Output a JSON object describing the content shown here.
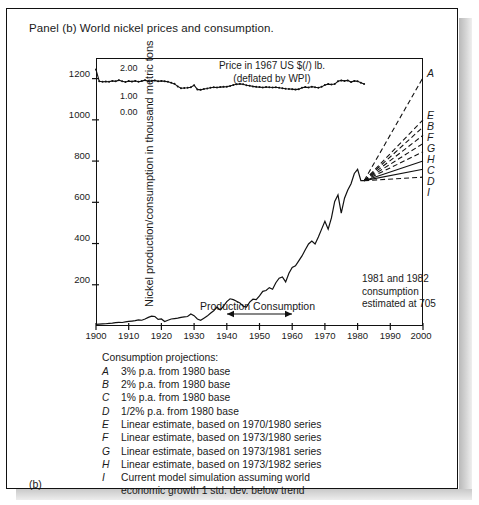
{
  "panel": {
    "title": "Panel (b)  World nickel prices and consumption.",
    "figure_label": "(b)"
  },
  "axes": {
    "ylabel": "Nickel production/consumption in thousand metric tons",
    "yticks": [
      "200",
      "400",
      "600",
      "800",
      "1000",
      "1200"
    ],
    "xticks": [
      "1900",
      "1910",
      "1920",
      "1930",
      "1940",
      "1950",
      "1960",
      "1970",
      "1980",
      "1990",
      "2000"
    ],
    "price_ticks": [
      "0.00",
      "1.00",
      "2.00"
    ]
  },
  "inset": {
    "title_line1": "Price in 1967 US $(/) lb.",
    "title_line2": "(deflated by WPI)"
  },
  "annotations": {
    "estimate": {
      "line1": "1981 and 1982",
      "line2": "consumption",
      "line3": "estimated at 705"
    },
    "production_consumption": "Production Consumption"
  },
  "projection_labels": [
    "A",
    "E",
    "B",
    "F",
    "G",
    "H",
    "C",
    "D",
    "I"
  ],
  "legend": {
    "heading": "Consumption projections:",
    "items": [
      {
        "key": "A",
        "text": "3% p.a. from 1980 base"
      },
      {
        "key": "B",
        "text": "2% p.a. from 1980 base"
      },
      {
        "key": "C",
        "text": "1% p.a. from 1980 base"
      },
      {
        "key": "D",
        "text": "1/2% p.a. from 1980 base"
      },
      {
        "key": "E",
        "text": "Linear estimate, based on 1970/1980 series"
      },
      {
        "key": "F",
        "text": "Linear estimate, based on 1973/1980 series"
      },
      {
        "key": "G",
        "text": "Linear estimate, based on 1973/1981 series"
      },
      {
        "key": "H",
        "text": "Linear estimate, based on 1973/1982 series"
      },
      {
        "key": "I",
        "text": "Current model simulation assuming world"
      }
    ],
    "continuation": "economic growth 1 std. dev. below trend"
  },
  "colors": {
    "ink": "#1a1a1a",
    "line": "#111111",
    "page": "#ffffff"
  },
  "chart_data": {
    "type": "line",
    "title": "World nickel prices and consumption",
    "xlabel": "",
    "ylabel": "Nickel production/consumption in thousand metric tons",
    "xlim": [
      1900,
      2000
    ],
    "ylim": [
      0,
      1300
    ],
    "y2lim": [
      0,
      2.0
    ],
    "y2label": "Price in 1967 US $(/) lb. (deflated by WPI)",
    "grid": false,
    "legend_position": "below-axes",
    "series": [
      {
        "name": "Consumption",
        "axis": "left",
        "x": [
          1900,
          1901,
          1902,
          1903,
          1904,
          1905,
          1906,
          1907,
          1908,
          1909,
          1910,
          1911,
          1912,
          1913,
          1914,
          1915,
          1916,
          1917,
          1918,
          1919,
          1920,
          1921,
          1922,
          1923,
          1924,
          1925,
          1926,
          1927,
          1928,
          1929,
          1930,
          1931,
          1932,
          1933,
          1934,
          1935,
          1936,
          1937,
          1938,
          1939,
          1940,
          1941,
          1942,
          1943,
          1944,
          1945,
          1946,
          1947,
          1948,
          1949,
          1950,
          1951,
          1952,
          1953,
          1954,
          1955,
          1956,
          1957,
          1958,
          1959,
          1960,
          1961,
          1962,
          1963,
          1964,
          1965,
          1966,
          1967,
          1968,
          1969,
          1970,
          1971,
          1972,
          1973,
          1974,
          1975,
          1976,
          1977,
          1978,
          1979,
          1980,
          1981,
          1982
        ],
        "y": [
          8,
          9,
          10,
          11,
          13,
          14,
          16,
          18,
          17,
          20,
          22,
          24,
          26,
          30,
          28,
          34,
          42,
          48,
          46,
          32,
          34,
          22,
          28,
          34,
          36,
          38,
          42,
          44,
          46,
          58,
          50,
          34,
          28,
          38,
          48,
          62,
          74,
          92,
          78,
          96,
          118,
          132,
          128,
          120,
          112,
          96,
          92,
          116,
          130,
          128,
          146,
          168,
          172,
          186,
          178,
          210,
          232,
          238,
          214,
          256,
          284,
          292,
          316,
          340,
          370,
          398,
          412,
          398,
          432,
          470,
          508,
          470,
          524,
          604,
          636,
          548,
          620,
          660,
          690,
          740,
          760,
          705,
          705
        ]
      },
      {
        "name": "Price (1967 US $/lb, deflated by WPI)",
        "axis": "right",
        "x": [
          1900,
          1901,
          1902,
          1903,
          1904,
          1905,
          1906,
          1907,
          1908,
          1909,
          1910,
          1911,
          1912,
          1913,
          1914,
          1915,
          1916,
          1917,
          1918,
          1919,
          1920,
          1921,
          1922,
          1923,
          1924,
          1925,
          1926,
          1927,
          1928,
          1929,
          1930,
          1931,
          1932,
          1933,
          1934,
          1935,
          1936,
          1937,
          1938,
          1939,
          1940,
          1941,
          1942,
          1943,
          1944,
          1945,
          1946,
          1947,
          1948,
          1949,
          1950,
          1951,
          1952,
          1953,
          1954,
          1955,
          1956,
          1957,
          1958,
          1959,
          1960,
          1961,
          1962,
          1963,
          1964,
          1965,
          1966,
          1967,
          1968,
          1969,
          1970,
          1971,
          1972,
          1973,
          1974,
          1975,
          1976,
          1977,
          1978,
          1979,
          1980,
          1981,
          1982
        ],
        "y": [
          1.93,
          1.42,
          1.4,
          1.41,
          1.4,
          1.44,
          1.42,
          1.47,
          1.42,
          1.39,
          1.43,
          1.41,
          1.44,
          1.4,
          1.43,
          1.47,
          1.42,
          1.44,
          1.46,
          1.42,
          1.44,
          1.42,
          1.4,
          1.36,
          1.31,
          1.2,
          1.12,
          1.13,
          1.14,
          1.16,
          1.25,
          1.07,
          1.05,
          1.09,
          1.11,
          1.14,
          1.16,
          1.15,
          1.17,
          1.18,
          1.19,
          1.22,
          1.26,
          1.29,
          1.31,
          1.29,
          1.25,
          1.23,
          1.2,
          1.18,
          1.17,
          1.15,
          1.17,
          1.16,
          1.15,
          1.16,
          1.14,
          1.12,
          1.1,
          1.09,
          1.08,
          1.06,
          1.08,
          1.14,
          1.17,
          1.15,
          1.19,
          1.16,
          1.14,
          1.18,
          1.26,
          1.3,
          1.28,
          1.3,
          1.42,
          1.46,
          1.44,
          1.46,
          1.39,
          1.44,
          1.42,
          1.36,
          1.3
        ]
      }
    ],
    "projections": [
      {
        "key": "A",
        "label": "3% p.a. from 1980 base",
        "from": [
          1982,
          705
        ],
        "to": [
          2000,
          1205
        ],
        "style": "dashed"
      },
      {
        "key": "E",
        "label": "Linear estimate, based on 1970/1980 series",
        "from": [
          1982,
          705
        ],
        "to": [
          2000,
          1000
        ],
        "style": "dashed"
      },
      {
        "key": "B",
        "label": "2% p.a. from 1980 base",
        "from": [
          1982,
          705
        ],
        "to": [
          2000,
          965
        ],
        "style": "dashed"
      },
      {
        "key": "F",
        "label": "Linear estimate, based on 1973/1980 series",
        "from": [
          1982,
          705
        ],
        "to": [
          2000,
          925
        ],
        "style": "dashed"
      },
      {
        "key": "G",
        "label": "Linear estimate, based on 1973/1981 series",
        "from": [
          1982,
          705
        ],
        "to": [
          2000,
          885
        ],
        "style": "dashed"
      },
      {
        "key": "H",
        "label": "Linear estimate, based on 1973/1982 series",
        "from": [
          1982,
          705
        ],
        "to": [
          2000,
          845
        ],
        "style": "dashed"
      },
      {
        "key": "C",
        "label": "1% p.a. from 1980 base",
        "from": [
          1982,
          705
        ],
        "to": [
          2000,
          800
        ],
        "style": "solid"
      },
      {
        "key": "D",
        "label": "1/2% p.a. from 1980 base",
        "from": [
          1982,
          705
        ],
        "to": [
          2000,
          760
        ],
        "style": "solid"
      },
      {
        "key": "I",
        "label": "Current model simulation assuming world economic growth 1 std. dev. below trend",
        "from": [
          1982,
          705
        ],
        "to": [
          2000,
          722
        ],
        "style": "dashed"
      }
    ],
    "annotations": [
      {
        "text": "1981 and 1982 consumption estimated at 705",
        "x": 1965,
        "y": 360
      },
      {
        "text": "Production Consumption",
        "x": 1938,
        "y": 120
      }
    ]
  }
}
